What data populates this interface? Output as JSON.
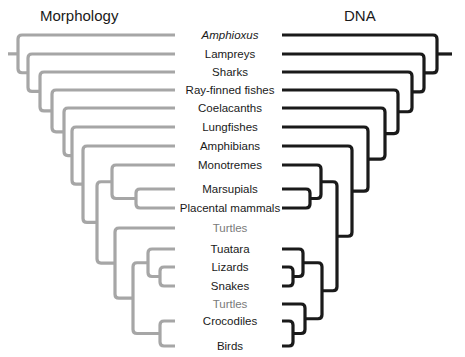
{
  "titles": {
    "left": "Morphology",
    "right": "DNA"
  },
  "colors": {
    "morphology_tree": "#a6a6a6",
    "dna_tree": "#1a1a1a",
    "label_text": "#1a1a1a",
    "muted_label_text": "#7a7a7a"
  },
  "taxa": [
    {
      "name": "Amphioxus",
      "y": 35,
      "style": "italic"
    },
    {
      "name": "Lampreys",
      "y": 54,
      "style": "normal"
    },
    {
      "name": "Sharks",
      "y": 72,
      "style": "normal"
    },
    {
      "name": "Ray-finned fishes",
      "y": 90,
      "style": "normal"
    },
    {
      "name": "Coelacanths",
      "y": 108,
      "style": "normal"
    },
    {
      "name": "Lungfishes",
      "y": 127,
      "style": "normal"
    },
    {
      "name": "Amphibians",
      "y": 146,
      "style": "normal"
    },
    {
      "name": "Monotremes",
      "y": 165,
      "style": "normal"
    },
    {
      "name": "Marsupials",
      "y": 189,
      "style": "normal"
    },
    {
      "name": "Placental mammals",
      "y": 208,
      "style": "normal"
    },
    {
      "name": "Turtles",
      "y": 228,
      "style": "muted"
    },
    {
      "name": "Tuatara",
      "y": 249,
      "style": "normal"
    },
    {
      "name": "Lizards",
      "y": 267,
      "style": "normal"
    },
    {
      "name": "Snakes",
      "y": 286,
      "style": "normal"
    },
    {
      "name": "Turtles",
      "y": 304,
      "style": "muted"
    },
    {
      "name": "Crocodiles",
      "y": 321,
      "style": "normal"
    },
    {
      "name": "Birds",
      "y": 346,
      "style": "normal"
    }
  ],
  "trees": {
    "morphology": {
      "description": "Tree based on morphology; turtles placed as sister to lepidosaurs+archosaurs",
      "topology": "(Amphioxus,(Lampreys,(Sharks,(Ray-finned fishes,(Coelacanths,(Lungfishes,(Amphibians,((Monotremes,(Marsupials,Placental mammals)),(Turtles,((Tuatara,(Lizards,Snakes)),(Crocodiles,Birds)))))))))))"
    },
    "dna": {
      "description": "Tree based on DNA; turtles placed as sister to archosaurs",
      "topology": "(Amphioxus,(Lampreys,(Sharks,(Ray-finned fishes,(Coelacanths,(Lungfishes,(Amphibians,((Monotremes,(Marsupials,Placental mammals)),((Tuatara,(Lizards,Snakes)),(Turtles,(Crocodiles,Birds)))))))))))"
    }
  }
}
